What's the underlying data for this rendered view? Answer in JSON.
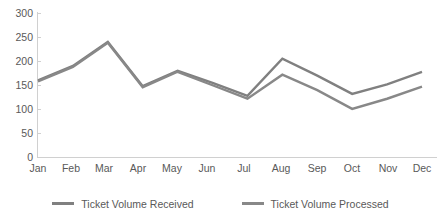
{
  "chart_data": {
    "type": "line",
    "title": "",
    "xlabel": "",
    "ylabel": "",
    "categories": [
      "Jan",
      "Feb",
      "Mar",
      "Apr",
      "May",
      "Jun",
      "Jul",
      "Aug",
      "Sep",
      "Oct",
      "Nov",
      "Dec"
    ],
    "ylim": [
      0,
      300
    ],
    "yticks": [
      0,
      50,
      100,
      150,
      200,
      250,
      300
    ],
    "grid": false,
    "legend_position": "bottom",
    "series": [
      {
        "name": "Ticket Volume Received",
        "color": "#808080",
        "values": [
          160,
          190,
          240,
          148,
          180,
          155,
          128,
          205,
          170,
          132,
          152,
          178
        ]
      },
      {
        "name": "Ticket Volume Processed",
        "color": "#888888",
        "values": [
          158,
          188,
          238,
          146,
          178,
          150,
          122,
          172,
          140,
          101,
          122,
          147
        ]
      }
    ]
  },
  "axis": {
    "y_tick_labels": [
      "300",
      "250",
      "200",
      "150",
      "100",
      "50",
      "0"
    ],
    "x_tick_labels": [
      "Jan",
      "Feb",
      "Mar",
      "Apr",
      "May",
      "Jun",
      "Jul",
      "Aug",
      "Sep",
      "Oct",
      "Nov",
      "Dec"
    ]
  },
  "legend": {
    "items": [
      {
        "label": "Ticket Volume Received",
        "color": "#808080"
      },
      {
        "label": "Ticket Volume Processed",
        "color": "#888888"
      }
    ]
  },
  "colors": {
    "axis": "#d0d0d0",
    "tick_text": "#595959",
    "background": "#ffffff"
  }
}
